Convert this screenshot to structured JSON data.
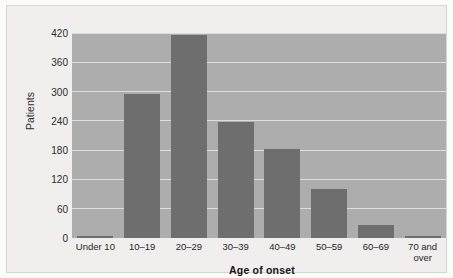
{
  "chart_data": {
    "type": "bar",
    "title": "",
    "xlabel": "Age of onset",
    "ylabel": "Patients",
    "categories": [
      "Under 10",
      "10–19",
      "20–29",
      "30–39",
      "40–49",
      "50–59",
      "60–69",
      "70 and\nover"
    ],
    "values": [
      5,
      295,
      415,
      238,
      183,
      100,
      26,
      5
    ],
    "ylim": [
      0,
      420
    ],
    "yticks": [
      0,
      60,
      120,
      180,
      240,
      300,
      360,
      420
    ],
    "ytick_labels": [
      "0",
      "60",
      "120",
      "180",
      "240",
      "300",
      "360",
      "420"
    ],
    "grid": true,
    "legend": "none",
    "colors": {
      "bar_fill": "#6e6e6e",
      "plot_background": "#adadad",
      "gridline": "#e6e6e6",
      "canvas_background": "#f1efee",
      "text": "#1f1f1f"
    }
  }
}
